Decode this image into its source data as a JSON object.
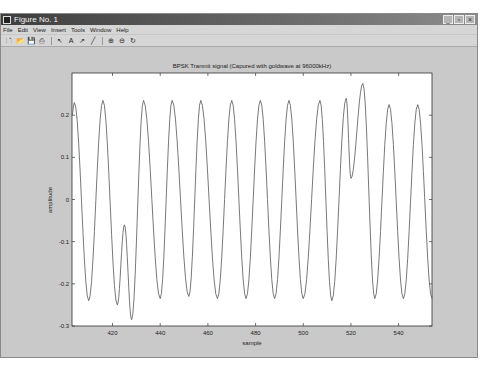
{
  "window": {
    "title": "Figure No. 1",
    "controls": [
      "minimize",
      "restore",
      "close"
    ]
  },
  "menu": [
    "File",
    "Edit",
    "View",
    "Insert",
    "Tools",
    "Window",
    "Help"
  ],
  "toolbar": [
    {
      "name": "new-figure-icon",
      "glyph": "🗋"
    },
    {
      "name": "open-file-icon",
      "glyph": "📂"
    },
    {
      "name": "save-icon",
      "glyph": "💾"
    },
    {
      "name": "print-icon",
      "glyph": "⎙"
    },
    {
      "name": "sep"
    },
    {
      "name": "select-arrow-icon",
      "glyph": "↖"
    },
    {
      "name": "insert-text-icon",
      "glyph": "A"
    },
    {
      "name": "insert-arrow-icon",
      "glyph": "↗"
    },
    {
      "name": "insert-line-icon",
      "glyph": "╱"
    },
    {
      "name": "sep"
    },
    {
      "name": "zoom-in-icon",
      "glyph": "⊕"
    },
    {
      "name": "zoom-out-icon",
      "glyph": "⊖"
    },
    {
      "name": "rotate-3d-icon",
      "glyph": "↻"
    }
  ],
  "chart_data": {
    "type": "line",
    "title": "BPSK Tranmit signal (Capured with goldwave at 96000kHz)",
    "xlabel": "sample",
    "ylabel": "amplitude",
    "xlim": [
      403,
      554
    ],
    "ylim": [
      -0.3,
      0.3
    ],
    "xticks": [
      420,
      440,
      460,
      480,
      500,
      520,
      540
    ],
    "yticks": [
      -0.3,
      -0.2,
      -0.1,
      0,
      0.1,
      0.2
    ],
    "ytick_labels": [
      "-0.3",
      "-0.2",
      "-0.1",
      "0",
      "0.1",
      "0.2"
    ],
    "grid": false,
    "line_color": "#555555",
    "keypoints": [
      [
        403,
        0.2
      ],
      [
        404,
        0.23
      ],
      [
        410,
        -0.24
      ],
      [
        416,
        0.235
      ],
      [
        422,
        -0.25
      ],
      [
        425,
        -0.06
      ],
      [
        428,
        -0.285
      ],
      [
        433,
        0.235
      ],
      [
        440,
        -0.235
      ],
      [
        445,
        0.235
      ],
      [
        452,
        -0.23
      ],
      [
        457,
        0.235
      ],
      [
        464,
        -0.235
      ],
      [
        470,
        0.235
      ],
      [
        476,
        -0.235
      ],
      [
        482,
        0.235
      ],
      [
        488,
        -0.235
      ],
      [
        494,
        0.235
      ],
      [
        500,
        -0.235
      ],
      [
        507,
        0.235
      ],
      [
        512,
        -0.24
      ],
      [
        518,
        0.24
      ],
      [
        520,
        0.05
      ],
      [
        525,
        0.275
      ],
      [
        530,
        -0.235
      ],
      [
        536,
        0.225
      ],
      [
        542,
        -0.235
      ],
      [
        548,
        0.225
      ],
      [
        554,
        -0.235
      ]
    ]
  }
}
